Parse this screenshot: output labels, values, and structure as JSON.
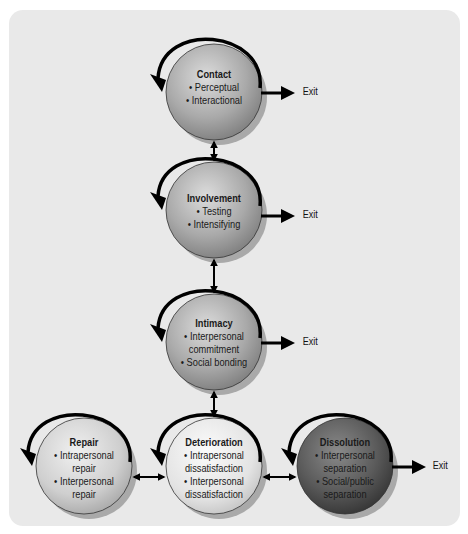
{
  "diagram": {
    "title": "",
    "nodes": [
      {
        "id": "contact",
        "label": "Contact",
        "items": [
          "Perceptual",
          "Interactional"
        ],
        "has_exit": true,
        "shade": "medium"
      },
      {
        "id": "involvement",
        "label": "Involvement",
        "items": [
          "Testing",
          "Intensifying"
        ],
        "has_exit": true,
        "shade": "medium"
      },
      {
        "id": "intimacy",
        "label": "Intimacy",
        "items": [
          "Interpersonal commitment",
          "Social bonding"
        ],
        "has_exit": true,
        "shade": "medium"
      },
      {
        "id": "repair",
        "label": "Repair",
        "items": [
          "Intrapersonal repair",
          "Interpersonal repair"
        ],
        "has_exit": false,
        "shade": "light"
      },
      {
        "id": "deterioration",
        "label": "Deterioration",
        "items": [
          "Intrapersonal dissatisfaction",
          "Interpersonal dissatisfaction"
        ],
        "has_exit": false,
        "shade": "lighter"
      },
      {
        "id": "dissolution",
        "label": "Dissolution",
        "items": [
          "Interpersonal separation",
          "Social/public separation"
        ],
        "has_exit": true,
        "shade": "dark"
      }
    ],
    "edges": [
      {
        "from": "contact",
        "to": "involvement",
        "type": "bidirectional"
      },
      {
        "from": "involvement",
        "to": "intimacy",
        "type": "bidirectional"
      },
      {
        "from": "intimacy",
        "to": "deterioration",
        "type": "bidirectional"
      },
      {
        "from": "repair",
        "to": "deterioration",
        "type": "bidirectional"
      },
      {
        "from": "deterioration",
        "to": "dissolution",
        "type": "unidirectional"
      }
    ],
    "self_loops": [
      "contact",
      "involvement",
      "intimacy",
      "repair",
      "deterioration",
      "dissolution"
    ],
    "exit_label": "Exit",
    "colors": {
      "panel_background": "#e9e9e9",
      "sphere_medium": "#a8a8a8",
      "sphere_light": "#d0d0d0",
      "sphere_lighter": "#e0e0e0",
      "sphere_dark": "#555555",
      "arrow": "#000000"
    }
  },
  "labels": {
    "contact": {
      "title": "Contact",
      "i1": "Perceptual",
      "i2": "Interactional"
    },
    "involvement": {
      "title": "Involvement",
      "i1": "Testing",
      "i2": "Intensifying"
    },
    "intimacy": {
      "title": "Intimacy",
      "i1a": "Interpersonal",
      "i1b": "commitment",
      "i2": "Social bonding"
    },
    "repair": {
      "title": "Repair",
      "i1a": "Intrapersonal",
      "i1b": "repair",
      "i2a": "Interpersonal",
      "i2b": "repair"
    },
    "deterioration": {
      "title": "Deterioration",
      "i1a": "Intrapersonal",
      "i1b": "dissatisfaction",
      "i2a": "Interpersonal",
      "i2b": "dissatisfaction"
    },
    "dissolution": {
      "title": "Dissolution",
      "i1a": "Interpersonal",
      "i1b": "separation",
      "i2a": "Social/public",
      "i2b": "separation"
    },
    "exit": "Exit"
  }
}
